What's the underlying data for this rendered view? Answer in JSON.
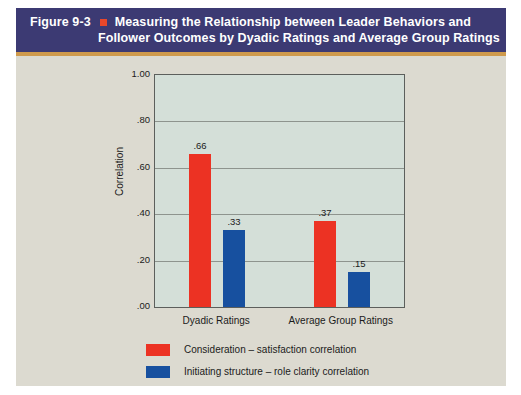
{
  "figure": {
    "number": "Figure 9-3",
    "bullet": "square-bullet",
    "title_line_1": "Measuring the Relationship between Leader Behaviors and",
    "title_line_2": "Follower Outcomes by Dyadic Ratings and Average Group Ratings",
    "header_color": "#3c3a73",
    "rule_color": "#cf9a4c",
    "page_background": "#dcdad0"
  },
  "chart_data": {
    "type": "bar",
    "title": "Measuring the Relationship between Leader Behaviors and Follower Outcomes by Dyadic Ratings and Average Group Ratings",
    "xlabel": "",
    "ylabel": "Correlation",
    "ylim": [
      0.0,
      1.0
    ],
    "ytick_labels": [
      "1.00",
      ".80",
      ".60",
      ".40",
      ".20",
      ".00"
    ],
    "ytick_values": [
      1.0,
      0.8,
      0.6,
      0.4,
      0.2,
      0.0
    ],
    "categories": [
      "Dyadic Ratings",
      "Average Group Ratings"
    ],
    "grid": true,
    "legend_position": "bottom",
    "plot_background": "#d4dfd8",
    "series": [
      {
        "name": "Consideration – satisfaction correlation",
        "color": "#ec3223",
        "values": [
          0.66,
          0.37
        ],
        "labels": [
          ".66",
          ".37"
        ]
      },
      {
        "name": "Initiating structure – role clarity correlation",
        "color": "#17509f",
        "values": [
          0.33,
          0.15
        ],
        "labels": [
          ".33",
          ".15"
        ]
      }
    ]
  }
}
